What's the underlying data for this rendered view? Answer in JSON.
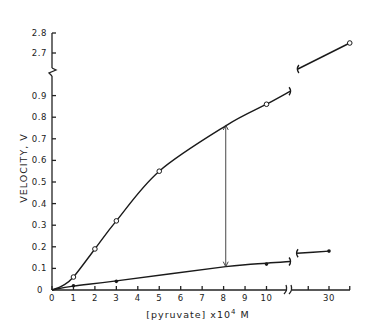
{
  "chart_data": {
    "type": "line",
    "title": "",
    "xlabel": "[pyruvate] x10⁴ M",
    "xlabel_parts": {
      "prefix": "[pyruvate] x10",
      "sup": "4",
      "suffix": " M"
    },
    "ylabel": "VELOCITY, V",
    "grid": false,
    "legend": null,
    "x_axis": {
      "range": [
        0,
        35
      ],
      "break_between": [
        11.3,
        21
      ],
      "ticks": [
        {
          "value": 0,
          "label": "0"
        },
        {
          "value": 1,
          "label": "1"
        },
        {
          "value": 2,
          "label": "2"
        },
        {
          "value": 3,
          "label": "3"
        },
        {
          "value": 4,
          "label": "4"
        },
        {
          "value": 5,
          "label": "5"
        },
        {
          "value": 6,
          "label": "6"
        },
        {
          "value": 7,
          "label": "7"
        },
        {
          "value": 8,
          "label": "8"
        },
        {
          "value": 9,
          "label": "9"
        },
        {
          "value": 10,
          "label": "10"
        },
        {
          "value": 25,
          "label": ""
        },
        {
          "value": 30,
          "label": "30"
        },
        {
          "value": 35,
          "label": ""
        }
      ]
    },
    "y_axis": {
      "range": [
        0,
        2.8
      ],
      "break_between": [
        0.99,
        2.64
      ],
      "ticks": [
        {
          "value": 0,
          "label": "0"
        },
        {
          "value": 0.1,
          "label": "0.1"
        },
        {
          "value": 0.2,
          "label": "0.2"
        },
        {
          "value": 0.3,
          "label": "0.3"
        },
        {
          "value": 0.4,
          "label": "0.4"
        },
        {
          "value": 0.5,
          "label": "0.5"
        },
        {
          "value": 0.6,
          "label": "0.6"
        },
        {
          "value": 0.7,
          "label": "0.7"
        },
        {
          "value": 0.8,
          "label": "0.8"
        },
        {
          "value": 0.9,
          "label": "0.9"
        },
        {
          "value": 2.7,
          "label": "2.7"
        },
        {
          "value": 2.8,
          "label": "2.8"
        }
      ]
    },
    "series": [
      {
        "name": "open circles (upper curve)",
        "marker": "open-circle",
        "points": [
          [
            1,
            0.06
          ],
          [
            2,
            0.19
          ],
          [
            3,
            0.32
          ],
          [
            5,
            0.55
          ],
          [
            10,
            0.86
          ],
          [
            35,
            2.75
          ]
        ],
        "curve_low": [
          [
            0,
            0
          ],
          [
            0.5,
            0.02
          ],
          [
            1,
            0.06
          ],
          [
            2,
            0.19
          ],
          [
            3,
            0.32
          ],
          [
            5,
            0.55
          ],
          [
            8.1,
            0.76
          ],
          [
            10,
            0.86
          ],
          [
            11.1,
            0.92
          ]
        ],
        "curve_high": [
          [
            22.5,
            2.62
          ],
          [
            35,
            2.75
          ]
        ]
      },
      {
        "name": "filled circles (lower line)",
        "marker": "filled-circle",
        "points": [
          [
            1,
            0.02
          ],
          [
            3,
            0.04
          ],
          [
            10,
            0.12
          ],
          [
            30,
            0.18
          ]
        ],
        "curve_low": [
          [
            0,
            0.0
          ],
          [
            1,
            0.018
          ],
          [
            3,
            0.042
          ],
          [
            8.1,
            0.108
          ],
          [
            10,
            0.124
          ],
          [
            11.1,
            0.132
          ]
        ],
        "curve_high": [
          [
            22.3,
            0.17
          ],
          [
            30,
            0.18
          ]
        ]
      }
    ],
    "annotations": [
      {
        "type": "double-headed-arrow",
        "x": 8.1,
        "y_from": 0.108,
        "y_to": 0.764
      }
    ]
  }
}
